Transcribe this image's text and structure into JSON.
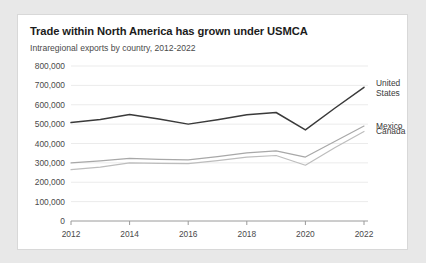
{
  "card": {
    "title": "Trade within North America has grown under USMCA",
    "subtitle": "Intraregional exports by country, 2012-2022"
  },
  "chart_data": {
    "type": "line",
    "title": "Trade within North America has grown under USMCA",
    "subtitle": "Intraregional exports by country, 2012-2022",
    "xlabel": "",
    "ylabel": "",
    "x": [
      2012,
      2013,
      2014,
      2015,
      2016,
      2017,
      2018,
      2019,
      2020,
      2021,
      2022
    ],
    "xtick_labels": [
      "2012",
      "2014",
      "2016",
      "2018",
      "2020",
      "2022"
    ],
    "xticks": [
      2012,
      2014,
      2016,
      2018,
      2020,
      2022
    ],
    "ytick_labels": [
      "0",
      "100,000",
      "200,000",
      "300,000",
      "400,000",
      "500,000",
      "600,000",
      "700,000",
      "800,000"
    ],
    "yticks": [
      0,
      100000,
      200000,
      300000,
      400000,
      500000,
      600000,
      700000,
      800000
    ],
    "ylim": [
      0,
      800000
    ],
    "xlim": [
      2012,
      2022
    ],
    "grid": true,
    "legend_position": "right",
    "series": [
      {
        "name": "United States",
        "label_lines": [
          "United",
          "States"
        ],
        "color": "#3a3a3a",
        "values": [
          508000,
          524000,
          550000,
          527000,
          500000,
          523000,
          548000,
          560000,
          470000,
          582000,
          690000
        ]
      },
      {
        "name": "Mexico",
        "label_lines": [
          "Mexico"
        ],
        "color": "#a8a8a8",
        "values": [
          300000,
          310000,
          323000,
          318000,
          315000,
          332000,
          352000,
          362000,
          330000,
          410000,
          490000
        ]
      },
      {
        "name": "Canada",
        "label_lines": [
          "Canada"
        ],
        "color": "#bdbdbd",
        "values": [
          265000,
          278000,
          300000,
          297000,
          296000,
          312000,
          330000,
          338000,
          288000,
          378000,
          462000
        ]
      }
    ]
  },
  "colors": {
    "card_background": "#ffffff",
    "page_background": "#e8e8e8",
    "grid": "#ebebeb",
    "axis": "#9a9a9a",
    "title_text": "#1c1c1c",
    "body_text": "#4a4a4a"
  }
}
